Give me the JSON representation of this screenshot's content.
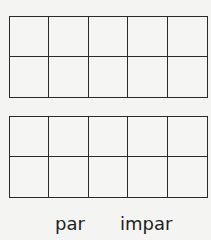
{
  "grids": [
    {
      "name": "ten-frame-top",
      "rows": 2,
      "cols": 5
    },
    {
      "name": "ten-frame-bottom",
      "rows": 2,
      "cols": 5
    }
  ],
  "labels": {
    "even": "par",
    "odd": "impar"
  },
  "colors": {
    "line": "#2a2a2a",
    "background": "#f4f4f2"
  }
}
